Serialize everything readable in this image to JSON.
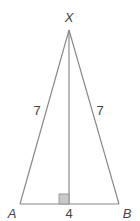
{
  "diagram": {
    "type": "isosceles-triangle",
    "vertices": {
      "apex": "X",
      "left": "A",
      "right": "B"
    },
    "side_labels": {
      "XA": "7",
      "XB": "7",
      "AB": "4"
    },
    "altitude": "from X perpendicular to AB (right-angle marker at foot)",
    "colors": {
      "stroke": "#8a8a8a",
      "right_angle_fill": "#c8c8c8",
      "text": "#444444"
    }
  }
}
